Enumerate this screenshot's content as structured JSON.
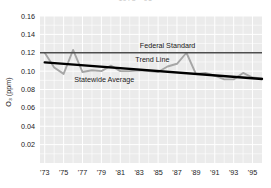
{
  "figure": {
    "cropped_title_fragment": "1973 - 95",
    "background_color": "#ffffff",
    "plot_background_color": "#ebebeb",
    "gridline_color": "#ffffff"
  },
  "chart_data": {
    "type": "line",
    "title": "",
    "xlabel": "",
    "ylabel": "O₃ (ppm)",
    "xlim": [
      1972.5,
      1996.0
    ],
    "ylim": [
      0.0,
      0.16
    ],
    "grid": true,
    "legend_position": "inline-annotations",
    "yticks": [
      "0.02",
      "0.04",
      "0.06",
      "0.08",
      "0.10",
      "0.12",
      "0.14",
      "0.16"
    ],
    "ytick_values": [
      0.02,
      0.04,
      0.06,
      0.08,
      0.1,
      0.12,
      0.14,
      0.16
    ],
    "xticks": [
      "'73",
      "'75",
      "'77",
      "'79",
      "'81",
      "'83",
      "'85",
      "'87",
      "'89",
      "'91",
      "'93",
      "'95"
    ],
    "xtick_values": [
      1973,
      1975,
      1977,
      1979,
      1981,
      1983,
      1985,
      1987,
      1989,
      1991,
      1993,
      1995
    ],
    "x": [
      1973,
      1974,
      1975,
      1976,
      1977,
      1978,
      1979,
      1980,
      1981,
      1982,
      1983,
      1984,
      1985,
      1986,
      1987,
      1988,
      1989,
      1990,
      1991,
      1992,
      1993,
      1994,
      1995,
      1996
    ],
    "series": [
      {
        "name": "Statewide Average",
        "color": "#a6a6a6",
        "line_width": 1.9,
        "values": [
          0.12,
          0.104,
          0.097,
          0.123,
          0.099,
          0.101,
          0.1,
          0.106,
          0.1,
          0.1,
          0.101,
          0.1,
          0.099,
          0.105,
          0.108,
          0.12,
          0.097,
          0.098,
          0.095,
          0.091,
          0.091,
          0.098,
          0.093,
          0.092
        ]
      },
      {
        "name": "Federal Standard",
        "color": "#4d4d4d",
        "line_width": 1.6,
        "constant_value": 0.12
      },
      {
        "name": "Trend Line",
        "color": "#000000",
        "line_width": 2.4,
        "start": {
          "x": 1973,
          "y": 0.1095
        },
        "end": {
          "x": 1996,
          "y": 0.0915
        }
      }
    ],
    "annotations": [
      {
        "name": "Federal Standard",
        "text": "Federal Standard",
        "x": 1986.0,
        "y": 0.1255
      },
      {
        "name": "Trend Line",
        "text": "Trend Line",
        "x": 1984.4,
        "y": 0.1095
      },
      {
        "name": "Statewide Average",
        "text": "Statewide Average",
        "x": 1979.3,
        "y": 0.0885
      }
    ]
  }
}
